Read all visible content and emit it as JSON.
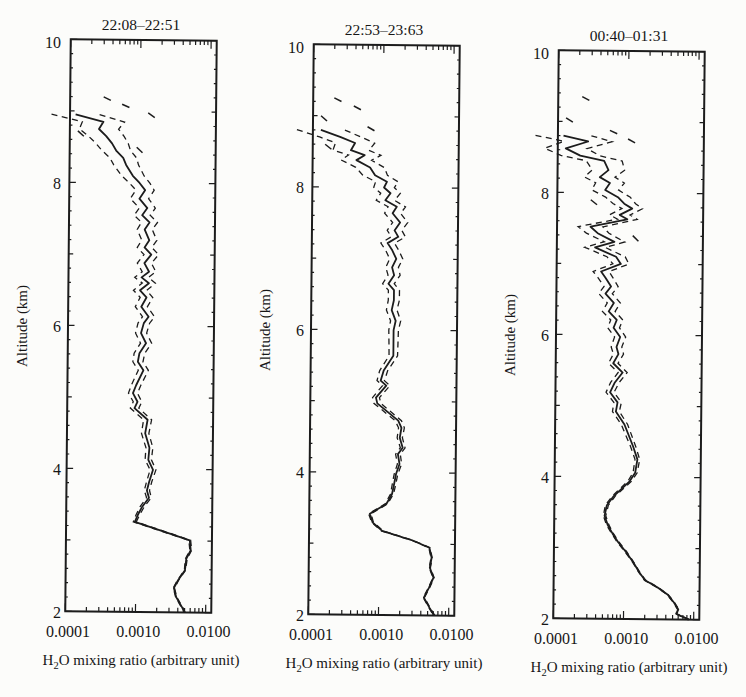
{
  "figure": {
    "background": "#fcfcfa",
    "ink_color": "#1c1c1c"
  },
  "chart_data": [
    {
      "type": "line",
      "title": "22:08–22:51",
      "xlabel": "H2O mixing ratio (arbitrary unit)",
      "xlabel_parts": {
        "pre": "H",
        "sub": "2",
        "post": "O mixing ratio (arbitrary unit)"
      },
      "ylabel": "Altitude (km)",
      "x_scale": "log",
      "xlim": [
        0.0001,
        0.012
      ],
      "ylim": [
        2,
        10
      ],
      "x_tick_values": [
        0.0001,
        0.001,
        0.01
      ],
      "x_tick_labels": [
        "0.0001",
        "0.0010",
        "0.0100"
      ],
      "y_tick_values": [
        2,
        4,
        6,
        8,
        10
      ],
      "grid": false,
      "legend": "none",
      "series": [
        {
          "name": "mean profile",
          "style": "solid"
        },
        {
          "name": "uncertainty bounds",
          "style": "dashed"
        }
      ],
      "profile": [
        [
          8.95,
          0.00012,
          2.2
        ],
        [
          8.85,
          0.0003,
          2.0
        ],
        [
          8.75,
          0.00026,
          1.9
        ],
        [
          8.65,
          0.00033,
          1.8
        ],
        [
          8.55,
          0.0004,
          1.7
        ],
        [
          8.45,
          0.00046,
          1.6
        ],
        [
          8.35,
          0.00058,
          1.55
        ],
        [
          8.25,
          0.00064,
          1.5
        ],
        [
          8.1,
          0.0008,
          1.45
        ],
        [
          8.0,
          0.001,
          1.4
        ],
        [
          7.9,
          0.0012,
          1.35
        ],
        [
          7.78,
          0.001,
          1.35
        ],
        [
          7.65,
          0.0013,
          1.3
        ],
        [
          7.55,
          0.0011,
          1.3
        ],
        [
          7.45,
          0.0014,
          1.3
        ],
        [
          7.35,
          0.0012,
          1.28
        ],
        [
          7.2,
          0.0014,
          1.28
        ],
        [
          7.1,
          0.0012,
          1.27
        ],
        [
          7.0,
          0.0015,
          1.27
        ],
        [
          6.88,
          0.0012,
          1.26
        ],
        [
          6.76,
          0.0014,
          1.25
        ],
        [
          6.68,
          0.0011,
          1.25
        ],
        [
          6.6,
          0.0014,
          1.24
        ],
        [
          6.5,
          0.00105,
          1.24
        ],
        [
          6.4,
          0.0013,
          1.23
        ],
        [
          6.27,
          0.0011,
          1.22
        ],
        [
          6.13,
          0.0014,
          1.22
        ],
        [
          6.04,
          0.0012,
          1.21
        ],
        [
          5.9,
          0.0011,
          1.2
        ],
        [
          5.76,
          0.0013,
          1.2
        ],
        [
          5.62,
          0.00105,
          1.19
        ],
        [
          5.5,
          0.001,
          1.18
        ],
        [
          5.38,
          0.0012,
          1.18
        ],
        [
          5.17,
          0.00095,
          1.17
        ],
        [
          5.06,
          0.00086,
          1.16
        ],
        [
          4.94,
          0.001,
          1.15
        ],
        [
          4.85,
          0.00091,
          1.15
        ],
        [
          4.69,
          0.0014,
          1.14
        ],
        [
          4.5,
          0.0013,
          1.13
        ],
        [
          4.3,
          0.0015,
          1.12
        ],
        [
          4.13,
          0.00145,
          1.11
        ],
        [
          3.99,
          0.0017,
          1.1
        ],
        [
          3.82,
          0.0015,
          1.09
        ],
        [
          3.7,
          0.0014,
          1.09
        ],
        [
          3.6,
          0.0015,
          1.08
        ],
        [
          3.47,
          0.0012,
          1.07
        ],
        [
          3.36,
          0.00105,
          1.06
        ],
        [
          3.26,
          0.00095,
          1.05
        ],
        [
          3.12,
          0.0026,
          1.04
        ],
        [
          3.01,
          0.0058,
          1.03
        ],
        [
          2.87,
          0.006,
          1.03
        ],
        [
          2.75,
          0.0052,
          1.03
        ],
        [
          2.59,
          0.005,
          1.02
        ],
        [
          2.45,
          0.004,
          1.02
        ],
        [
          2.34,
          0.0035,
          1.02
        ],
        [
          2.21,
          0.0038,
          1.02
        ],
        [
          2.07,
          0.0046,
          1.02
        ],
        [
          2.0,
          0.005,
          1.02
        ]
      ],
      "extra_dashes": [
        [
          9.2,
          0.0003,
          9.13,
          0.00042
        ],
        [
          9.1,
          0.00055,
          9.03,
          0.0008
        ],
        [
          8.98,
          0.0013,
          8.9,
          0.0017
        ],
        [
          8.72,
          0.00013,
          8.62,
          0.00017
        ],
        [
          8.5,
          0.0009,
          8.42,
          0.0011
        ]
      ]
    },
    {
      "type": "line",
      "title": "22:53–23:63",
      "xlabel": "H2O mixing ratio (arbitrary unit)",
      "xlabel_parts": {
        "pre": "H",
        "sub": "2",
        "post": "O mixing ratio (arbitrary unit)"
      },
      "ylabel": "Altitude (km)",
      "x_scale": "log",
      "xlim": [
        0.0001,
        0.012
      ],
      "ylim": [
        2,
        10
      ],
      "x_tick_values": [
        0.0001,
        0.001,
        0.01
      ],
      "x_tick_labels": [
        "0.0001",
        "0.0010",
        "0.0100"
      ],
      "y_tick_values": [
        2,
        4,
        6,
        8,
        10
      ],
      "grid": false,
      "legend": "none",
      "series": [
        {
          "name": "mean profile",
          "style": "solid"
        },
        {
          "name": "uncertainty bounds",
          "style": "dashed"
        }
      ],
      "profile": [
        [
          8.8,
          0.00013,
          2.2
        ],
        [
          8.7,
          0.00025,
          2.0
        ],
        [
          8.62,
          0.0004,
          1.9
        ],
        [
          8.52,
          0.00035,
          1.8
        ],
        [
          8.45,
          0.00055,
          1.7
        ],
        [
          8.38,
          0.00042,
          1.65
        ],
        [
          8.28,
          0.00066,
          1.6
        ],
        [
          8.17,
          0.00078,
          1.5
        ],
        [
          8.08,
          0.00115,
          1.45
        ],
        [
          8.0,
          0.00105,
          1.4
        ],
        [
          7.92,
          0.0013,
          1.38
        ],
        [
          7.82,
          0.0011,
          1.35
        ],
        [
          7.73,
          0.0016,
          1.33
        ],
        [
          7.64,
          0.0014,
          1.3
        ],
        [
          7.51,
          0.0018,
          1.28
        ],
        [
          7.4,
          0.0015,
          1.27
        ],
        [
          7.31,
          0.0017,
          1.26
        ],
        [
          7.22,
          0.0012,
          1.25
        ],
        [
          7.12,
          0.0014,
          1.24
        ],
        [
          7.0,
          0.0016,
          1.24
        ],
        [
          6.88,
          0.0014,
          1.23
        ],
        [
          6.77,
          0.0015,
          1.22
        ],
        [
          6.65,
          0.00125,
          1.21
        ],
        [
          6.56,
          0.0015,
          1.2
        ],
        [
          6.42,
          0.0015,
          1.2
        ],
        [
          6.28,
          0.0014,
          1.19
        ],
        [
          6.13,
          0.0016,
          1.18
        ],
        [
          6.0,
          0.0015,
          1.17
        ],
        [
          5.81,
          0.0015,
          1.16
        ],
        [
          5.64,
          0.0015,
          1.15
        ],
        [
          5.43,
          0.0011,
          1.14
        ],
        [
          5.29,
          0.001,
          1.13
        ],
        [
          5.22,
          0.0012,
          1.13
        ],
        [
          5.05,
          0.00086,
          1.12
        ],
        [
          4.97,
          0.0009,
          1.12
        ],
        [
          4.73,
          0.0018,
          1.11
        ],
        [
          4.63,
          0.002,
          1.1
        ],
        [
          4.49,
          0.0019,
          1.09
        ],
        [
          4.35,
          0.0021,
          1.08
        ],
        [
          4.26,
          0.0018,
          1.08
        ],
        [
          4.12,
          0.0019,
          1.07
        ],
        [
          3.98,
          0.0017,
          1.06
        ],
        [
          3.84,
          0.0016,
          1.06
        ],
        [
          3.7,
          0.0015,
          1.05
        ],
        [
          3.56,
          0.00125,
          1.04
        ],
        [
          3.42,
          0.00073,
          1.04
        ],
        [
          3.3,
          0.0008,
          1.03
        ],
        [
          3.18,
          0.0011,
          1.03
        ],
        [
          3.05,
          0.003,
          1.02
        ],
        [
          2.95,
          0.0052,
          1.02
        ],
        [
          2.81,
          0.0056,
          1.02
        ],
        [
          2.67,
          0.0053,
          1.02
        ],
        [
          2.53,
          0.006,
          1.02
        ],
        [
          2.39,
          0.0052,
          1.02
        ],
        [
          2.25,
          0.0044,
          1.02
        ],
        [
          2.11,
          0.0053,
          1.02
        ],
        [
          2.0,
          0.0062,
          1.02
        ]
      ],
      "extra_dashes": [
        [
          9.25,
          0.0002,
          9.18,
          0.00028
        ],
        [
          9.14,
          0.00038,
          9.07,
          0.00052
        ],
        [
          9.0,
          0.00013,
          8.92,
          0.00016
        ],
        [
          8.85,
          0.0006,
          8.78,
          0.0008
        ],
        [
          8.6,
          0.00015,
          8.52,
          0.00019
        ]
      ]
    },
    {
      "type": "line",
      "title": "00:40–01:31",
      "xlabel": "H2O mixing ratio (arbitrary unit)",
      "xlabel_parts": {
        "pre": "H",
        "sub": "2",
        "post": "O mixing ratio (arbitrary unit)"
      },
      "ylabel": "Altitude (km)",
      "x_scale": "log",
      "xlim": [
        0.0001,
        0.012
      ],
      "ylim": [
        2,
        10
      ],
      "x_tick_values": [
        0.0001,
        0.001,
        0.01
      ],
      "x_tick_labels": [
        "0.0001",
        "0.0010",
        "0.0100"
      ],
      "y_tick_values": [
        2,
        4,
        6,
        8,
        10
      ],
      "grid": false,
      "legend": "none",
      "series": [
        {
          "name": "mean profile",
          "style": "solid"
        },
        {
          "name": "uncertainty bounds",
          "style": "dashed"
        }
      ],
      "profile": [
        [
          8.8,
          0.00012,
          2.5
        ],
        [
          8.72,
          0.00027,
          2.2
        ],
        [
          8.62,
          0.00013,
          2.0
        ],
        [
          8.52,
          0.00021,
          1.9
        ],
        [
          8.45,
          0.00046,
          1.8
        ],
        [
          8.32,
          0.00053,
          1.7
        ],
        [
          8.22,
          0.0004,
          1.65
        ],
        [
          8.14,
          0.00056,
          1.6
        ],
        [
          8.04,
          0.00048,
          1.55
        ],
        [
          7.94,
          0.00073,
          1.5
        ],
        [
          7.85,
          0.0009,
          1.45
        ],
        [
          7.78,
          0.00117,
          1.4
        ],
        [
          7.69,
          0.00078,
          1.4
        ],
        [
          7.63,
          0.001,
          1.38
        ],
        [
          7.52,
          0.0003,
          1.5
        ],
        [
          7.43,
          0.00038,
          1.45
        ],
        [
          7.31,
          0.00066,
          1.4
        ],
        [
          7.23,
          0.00035,
          1.4
        ],
        [
          7.1,
          0.0007,
          1.35
        ],
        [
          7.0,
          0.00082,
          1.3
        ],
        [
          6.89,
          0.00043,
          1.3
        ],
        [
          6.8,
          0.0005,
          1.28
        ],
        [
          6.68,
          0.0006,
          1.26
        ],
        [
          6.58,
          0.0005,
          1.25
        ],
        [
          6.45,
          0.00066,
          1.24
        ],
        [
          6.33,
          0.00056,
          1.23
        ],
        [
          6.21,
          0.00073,
          1.22
        ],
        [
          6.1,
          0.00066,
          1.21
        ],
        [
          5.97,
          0.00082,
          1.2
        ],
        [
          5.83,
          0.00073,
          1.19
        ],
        [
          5.73,
          0.00078,
          1.18
        ],
        [
          5.6,
          0.00066,
          1.17
        ],
        [
          5.47,
          0.0009,
          1.16
        ],
        [
          5.33,
          0.0007,
          1.15
        ],
        [
          5.19,
          0.0006,
          1.14
        ],
        [
          5.05,
          0.00077,
          1.13
        ],
        [
          4.92,
          0.00073,
          1.12
        ],
        [
          4.74,
          0.00097,
          1.11
        ],
        [
          4.43,
          0.0013,
          1.09
        ],
        [
          4.25,
          0.0015,
          1.08
        ],
        [
          4.06,
          0.0014,
          1.07
        ],
        [
          3.94,
          0.00117,
          1.06
        ],
        [
          3.73,
          0.0007,
          1.05
        ],
        [
          3.6,
          0.00056,
          1.05
        ],
        [
          3.45,
          0.00052,
          1.04
        ],
        [
          3.32,
          0.00058,
          1.04
        ],
        [
          3.2,
          0.00068,
          1.03
        ],
        [
          3.08,
          0.00082,
          1.03
        ],
        [
          2.95,
          0.00105,
          1.03
        ],
        [
          2.8,
          0.00135,
          1.02
        ],
        [
          2.66,
          0.00165,
          1.02
        ],
        [
          2.55,
          0.002,
          1.02
        ],
        [
          2.45,
          0.003,
          1.02
        ],
        [
          2.35,
          0.0042,
          1.02
        ],
        [
          2.24,
          0.0052,
          1.02
        ],
        [
          2.14,
          0.006,
          1.02
        ],
        [
          2.08,
          0.0056,
          1.02
        ],
        [
          2.0,
          0.0085,
          1.02
        ]
      ],
      "extra_dashes": [
        [
          9.35,
          0.00022,
          9.28,
          0.0003
        ],
        [
          9.05,
          0.00013,
          8.98,
          0.00017
        ],
        [
          8.88,
          0.00055,
          8.82,
          0.00075
        ],
        [
          8.76,
          0.001,
          8.7,
          0.0013
        ],
        [
          7.9,
          0.0003,
          7.82,
          0.00038
        ],
        [
          7.4,
          0.0012,
          7.32,
          0.00145
        ]
      ]
    }
  ]
}
